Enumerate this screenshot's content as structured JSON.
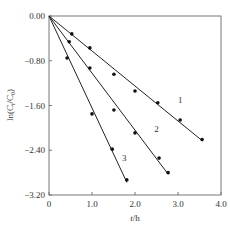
{
  "chart_data": {
    "type": "scatter",
    "title": "",
    "xlabel": "t/h",
    "ylabel": "ln(Ct/C0)",
    "xlim": [
      0,
      4.0
    ],
    "ylim": [
      -3.2,
      0.0
    ],
    "x_ticks": [
      "0",
      "1.0",
      "2.0",
      "3.0",
      "4.0"
    ],
    "y_ticks": [
      "0.00",
      "-0.80",
      "-1.60",
      "-2.40",
      "-3.20"
    ],
    "grid": false,
    "legend": "inline labels 1, 2, 3 next to lines",
    "series": [
      {
        "name": "1",
        "fit_line": true,
        "x": [
          0,
          0.53,
          0.95,
          1.51,
          2.0,
          2.53,
          3.05,
          3.56
        ],
        "y": [
          0,
          -0.32,
          -0.57,
          -1.04,
          -1.34,
          -1.55,
          -1.86,
          -2.21
        ]
      },
      {
        "name": "2",
        "fit_line": true,
        "x": [
          0,
          0.47,
          0.95,
          1.51,
          2.0,
          2.56,
          2.77
        ],
        "y": [
          0,
          -0.46,
          -0.93,
          -1.68,
          -2.09,
          -2.54,
          -2.8
        ]
      },
      {
        "name": "3",
        "fit_line": true,
        "x": [
          0,
          0.42,
          1.0,
          1.47,
          1.81
        ],
        "y": [
          0,
          -0.75,
          -1.75,
          -2.38,
          -2.93
        ]
      }
    ]
  }
}
